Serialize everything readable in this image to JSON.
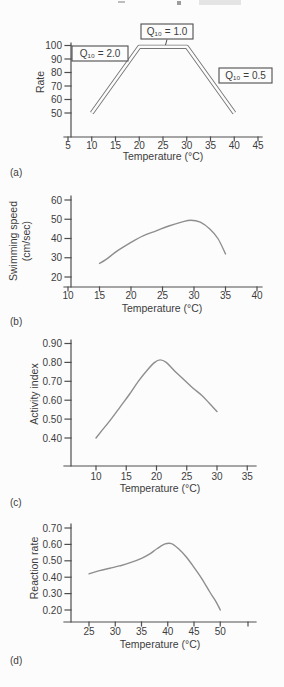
{
  "figure": {
    "bg": "#fcfcfc",
    "axis_color": "#4e4e4e",
    "text_color": "#3c3c3c",
    "curve_color": "#8e8e8e",
    "band_color": "#767676",
    "band_inner": "#fcfcfc",
    "box_border_color": "#4e4e4e",
    "box_fill": "#fcfcfc"
  },
  "chart_data": [
    {
      "id": "a",
      "type": "line",
      "panel_label": "(a)",
      "xlabel": "Temperature (°C)",
      "ylabel_lines": [
        "Rate"
      ],
      "xlim": [
        5,
        45
      ],
      "ylim": [
        50,
        100
      ],
      "xticks": [
        "5",
        "10",
        "15",
        "20",
        "25",
        "30",
        "35",
        "40",
        "45"
      ],
      "yticks": [
        "50",
        "60",
        "70",
        "80",
        "90",
        "100"
      ],
      "grid": false,
      "legend": "none",
      "line_style": "double-outline",
      "series": [
        {
          "name": "generalized-rate-curve",
          "smooth": false,
          "points": [
            [
              10,
              50
            ],
            [
              20,
              99
            ],
            [
              30,
              99
            ],
            [
              40,
              50
            ]
          ]
        }
      ],
      "annotations": [
        {
          "label": "Q₁₀ = 2.0"
        },
        {
          "label": "Q₁₀ = 1.0"
        },
        {
          "label": "Q₁₀ = 0.5"
        }
      ]
    },
    {
      "id": "b",
      "type": "line",
      "panel_label": "(b)",
      "xlabel": "Temperature (°C)",
      "ylabel_lines": [
        "Swimming speed",
        "(cm/sec)"
      ],
      "xlim": [
        10,
        40
      ],
      "ylim": [
        20,
        60
      ],
      "xticks": [
        "10",
        "15",
        "20",
        "25",
        "30",
        "35",
        "40"
      ],
      "yticks": [
        "20",
        "30",
        "40",
        "50",
        "60"
      ],
      "grid": false,
      "legend": "none",
      "line_style": "single",
      "series": [
        {
          "name": "swimming-speed-curve",
          "smooth": true,
          "points": [
            [
              15,
              27
            ],
            [
              16,
              29
            ],
            [
              18,
              34
            ],
            [
              20,
              38
            ],
            [
              22,
              41.5
            ],
            [
              24,
              44
            ],
            [
              26,
              46.5
            ],
            [
              28,
              48.5
            ],
            [
              29.5,
              49.5
            ],
            [
              31,
              48.5
            ],
            [
              32.5,
              45
            ],
            [
              33.8,
              40
            ],
            [
              35,
              32
            ]
          ]
        }
      ],
      "annotations": []
    },
    {
      "id": "c",
      "type": "line",
      "panel_label": "(c)",
      "xlabel": "Temperature (°C)",
      "ylabel_lines": [
        "Activity index"
      ],
      "xlim": [
        10,
        35
      ],
      "ylim": [
        0.4,
        0.9
      ],
      "xticks": [
        "10",
        "15",
        "20",
        "25",
        "30",
        "35"
      ],
      "yticks": [
        "0.40",
        "0.50",
        "0.60",
        "0.70",
        "0.80",
        "0.90"
      ],
      "grid": false,
      "legend": "none",
      "line_style": "single",
      "series": [
        {
          "name": "activity-index-curve",
          "smooth": true,
          "points": [
            [
              10,
              0.4
            ],
            [
              11,
              0.44
            ],
            [
              12.5,
              0.5
            ],
            [
              14,
              0.565
            ],
            [
              15.5,
              0.63
            ],
            [
              17,
              0.7
            ],
            [
              18.5,
              0.76
            ],
            [
              19.7,
              0.8
            ],
            [
              20.6,
              0.813
            ],
            [
              21.6,
              0.8
            ],
            [
              23,
              0.755
            ],
            [
              24.5,
              0.71
            ],
            [
              26,
              0.665
            ],
            [
              27.5,
              0.625
            ],
            [
              28.7,
              0.585
            ],
            [
              30,
              0.54
            ]
          ]
        }
      ],
      "annotations": []
    },
    {
      "id": "d",
      "type": "line",
      "panel_label": "(d)",
      "xlabel": "Temperature (°C)",
      "ylabel_lines": [
        "Reaction rate"
      ],
      "xlim": [
        25,
        50
      ],
      "ylim": [
        0.2,
        0.7
      ],
      "xticks": [
        "25",
        "30",
        "35",
        "40",
        "45",
        "50"
      ],
      "yticks": [
        "0.20",
        "0.30",
        "0.40",
        "0.50",
        "0.60",
        "0.70"
      ],
      "grid": false,
      "legend": "none",
      "line_style": "single",
      "series": [
        {
          "name": "reaction-rate-curve",
          "smooth": true,
          "points": [
            [
              25,
              0.42
            ],
            [
              27,
              0.44
            ],
            [
              29,
              0.455
            ],
            [
              31,
              0.47
            ],
            [
              33,
              0.49
            ],
            [
              35,
              0.515
            ],
            [
              36.5,
              0.54
            ],
            [
              38,
              0.575
            ],
            [
              39.5,
              0.603
            ],
            [
              40.7,
              0.605
            ],
            [
              42,
              0.575
            ],
            [
              43.5,
              0.525
            ],
            [
              45,
              0.46
            ],
            [
              46.5,
              0.39
            ],
            [
              48,
              0.31
            ],
            [
              49.2,
              0.25
            ],
            [
              50,
              0.2
            ]
          ]
        }
      ],
      "annotations": []
    }
  ]
}
